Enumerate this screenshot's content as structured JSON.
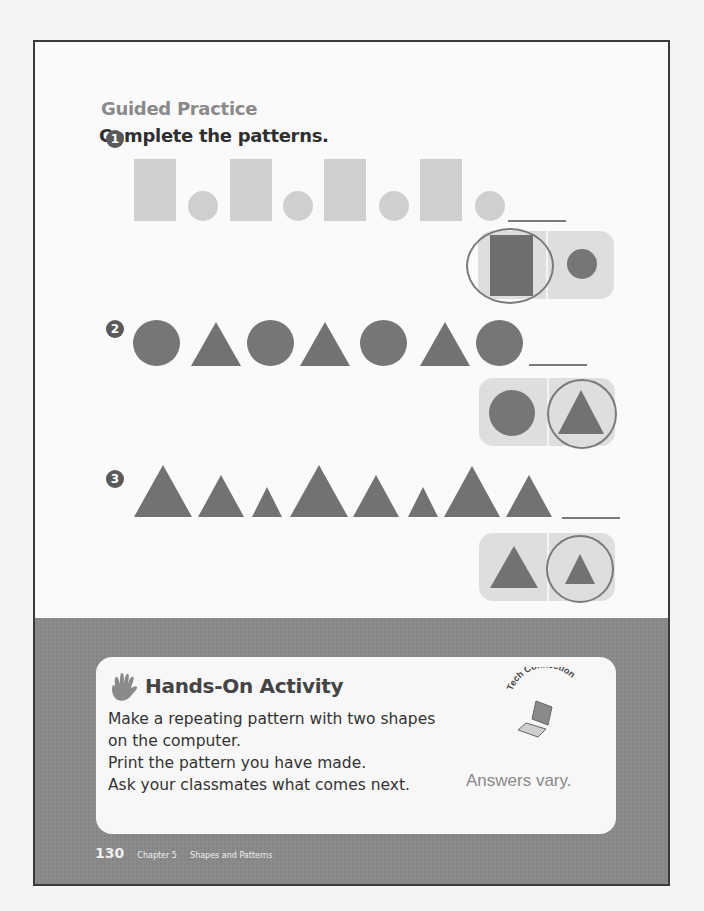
{
  "page": {
    "section_label": "Guided Practice",
    "instruction": "Complete the patterns.",
    "problems": [
      {
        "number": "1",
        "sequence": [
          "rectangle",
          "circle",
          "rectangle",
          "circle",
          "rectangle",
          "circle",
          "rectangle",
          "circle"
        ],
        "choices": [
          "rectangle",
          "circle"
        ],
        "circled_choice": "rectangle"
      },
      {
        "number": "2",
        "sequence": [
          "circle",
          "triangle",
          "circle",
          "triangle",
          "circle",
          "triangle",
          "circle"
        ],
        "choices": [
          "circle",
          "triangle"
        ],
        "circled_choice": "triangle"
      },
      {
        "number": "3",
        "sequence": [
          "large triangle",
          "medium triangle",
          "small triangle",
          "large triangle",
          "medium triangle",
          "small triangle",
          "large triangle",
          "medium triangle"
        ],
        "choices": [
          "medium triangle",
          "small triangle"
        ],
        "circled_choice": "small triangle"
      }
    ],
    "activity": {
      "title": "Hands-On Activity",
      "lines": [
        "Make a repeating pattern with two shapes",
        "on the computer.",
        "Print the pattern you have made.",
        "Ask your classmates what comes next."
      ],
      "tech_connection": "Tech Connection",
      "answer_note": "Answers vary."
    },
    "footer": {
      "page_number": "130",
      "chapter": "Chapter 5",
      "chapter_title": "Shapes and Patterns"
    }
  },
  "colors": {
    "light_shape": "#cfcfcf",
    "dark_shape": "#727272",
    "band": "#8b8b8b",
    "title_gray": "#8a8a8a"
  }
}
